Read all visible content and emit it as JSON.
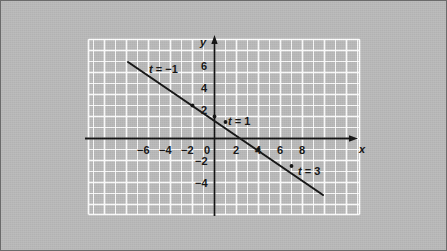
{
  "figure": {
    "background_color": "#b9b9b9",
    "border_color": "#6b6b6b",
    "grid_color": "#ffffff",
    "axis_color": "#111111",
    "curve_color": "#111111"
  },
  "chart_data": {
    "type": "line",
    "title": "",
    "subtitle": "",
    "xlabel": "x",
    "ylabel": "y",
    "xlim": [
      -7,
      9.5
    ],
    "ylim": [
      -6,
      7
    ],
    "grid": true,
    "grid_step": 1,
    "legend_position": "none",
    "x_ticks": [
      -6,
      -4,
      -2,
      0,
      2,
      4,
      6,
      8
    ],
    "x_tick_labels": [
      "−6",
      "−4",
      "−2",
      "0",
      "2",
      "4",
      "6",
      "8"
    ],
    "y_ticks": [
      6,
      4,
      2,
      -2,
      -4
    ],
    "y_tick_labels": [
      "6",
      "4",
      "2",
      "−2",
      "−4"
    ],
    "series": [
      {
        "name": "parametric line",
        "type": "line",
        "equation_y_intercept": 2,
        "slope": -0.5,
        "x": [
          -7.8,
          10.0
        ],
        "y": [
          5.9,
          -3.0
        ],
        "points": [
          {
            "t": -1,
            "x": -2,
            "y": 3,
            "label": "t = −1"
          },
          {
            "t": 0,
            "x": 0,
            "y": 2,
            "label": ""
          },
          {
            "t": 1,
            "x": 1,
            "y": 1.5,
            "label": "t = 1"
          },
          {
            "t": 2,
            "x": 4,
            "y": -1,
            "label": ""
          },
          {
            "t": 3,
            "x": 7,
            "y": -2.5,
            "label": "t = 3"
          }
        ]
      }
    ],
    "annotations": [
      {
        "id": "t-neg1",
        "text_prefix": "t",
        "text_rest": " = −1",
        "full_text": "t = −1",
        "x": -1.1,
        "y": 4.3
      },
      {
        "id": "t-1",
        "text_prefix": "t",
        "text_rest": " = 1",
        "full_text": "t = 1",
        "x": 2.1,
        "y": 1.5
      },
      {
        "id": "t-3",
        "text_prefix": "t",
        "text_rest": " = 3",
        "full_text": "t = 3",
        "x": 7.9,
        "y": -2.0
      }
    ],
    "axis_labels": {
      "x": "x",
      "y": "y"
    }
  }
}
